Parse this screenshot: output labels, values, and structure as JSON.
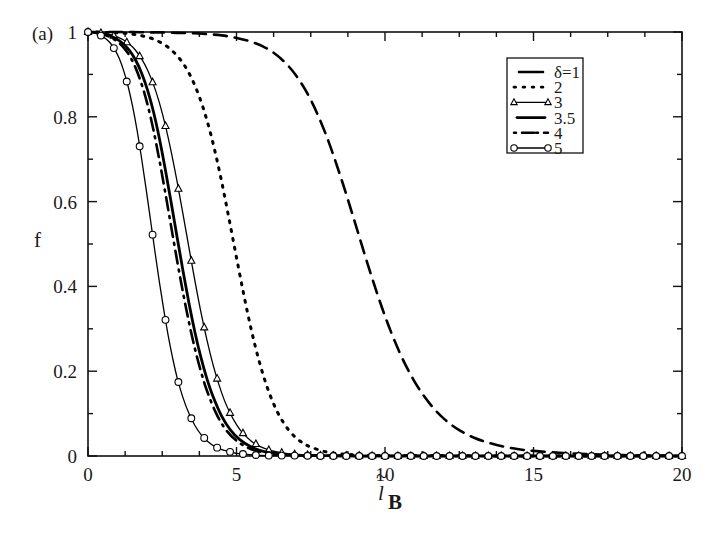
{
  "figure": {
    "panel_label": "(a)",
    "background_color": "#ffffff",
    "foreground_color": "#000000"
  },
  "chart_data": {
    "type": "line",
    "title": "",
    "subtitle": "",
    "panel": "(a)",
    "xlabel": "l~B",
    "xlabel_parts": {
      "base": "l",
      "accent": "~",
      "subscript": "B"
    },
    "ylabel": "f",
    "xlim": [
      0,
      20
    ],
    "ylim": [
      0,
      1
    ],
    "xticks": [
      0,
      5,
      10,
      15,
      20
    ],
    "xticklabels": [
      "0",
      "5",
      "10",
      "15",
      "20"
    ],
    "yticks": [
      0,
      0.2,
      0.4,
      0.6,
      0.8,
      1
    ],
    "yticklabels": [
      "0",
      "0.2",
      "0.4",
      "0.6",
      "0.8",
      "1"
    ],
    "x_minor_ticks": [
      1.25,
      2.5,
      3.75,
      6.25,
      7.5,
      8.75,
      11.25,
      12.5,
      13.75,
      16.25,
      17.5,
      18.75
    ],
    "y_minor_ticks": [
      0.1,
      0.3,
      0.5,
      0.7,
      0.9
    ],
    "grid": false,
    "legend_position": "upper right",
    "legend_title": "",
    "series": [
      {
        "name": "delta=1",
        "label": "δ=1",
        "linestyle": "dashed",
        "dasharray": "13,8",
        "linewidth": 2.6,
        "marker": "none",
        "midpoint_x": 9.3,
        "x": [
          0,
          0.5,
          1,
          1.5,
          2,
          2.5,
          3,
          3.5,
          4,
          4.5,
          5,
          5.5,
          6,
          6.5,
          7,
          7.5,
          8,
          8.5,
          9,
          9.5,
          10,
          10.5,
          11,
          11.5,
          12,
          12.5,
          13,
          13.5,
          14,
          14.5,
          15,
          16,
          17,
          18,
          19,
          20
        ],
        "y": [
          1,
          1,
          1,
          1,
          0.999,
          0.999,
          0.998,
          0.997,
          0.995,
          0.992,
          0.986,
          0.977,
          0.962,
          0.937,
          0.898,
          0.84,
          0.76,
          0.66,
          0.548,
          0.434,
          0.33,
          0.243,
          0.175,
          0.124,
          0.087,
          0.061,
          0.043,
          0.031,
          0.022,
          0.016,
          0.012,
          0.007,
          0.004,
          0.002,
          0.001,
          0.001
        ]
      },
      {
        "name": "delta=2",
        "label": "2",
        "linestyle": "dotted",
        "dasharray": "2,7",
        "linewidth": 3.0,
        "marker": "none",
        "midpoint_x": 4.9,
        "x": [
          0,
          0.25,
          0.5,
          0.75,
          1,
          1.25,
          1.5,
          1.75,
          2,
          2.25,
          2.5,
          2.75,
          3,
          3.25,
          3.5,
          3.75,
          4,
          4.25,
          4.5,
          4.75,
          5,
          5.25,
          5.5,
          5.75,
          6,
          6.25,
          6.5,
          6.75,
          7,
          7.25,
          7.5,
          8,
          8.5,
          9,
          10,
          12,
          14,
          16,
          18,
          20
        ],
        "y": [
          1,
          1,
          0.999,
          0.999,
          0.998,
          0.997,
          0.995,
          0.992,
          0.988,
          0.982,
          0.973,
          0.961,
          0.944,
          0.921,
          0.889,
          0.847,
          0.793,
          0.726,
          0.647,
          0.559,
          0.468,
          0.379,
          0.297,
          0.227,
          0.169,
          0.123,
          0.088,
          0.062,
          0.043,
          0.03,
          0.021,
          0.01,
          0.005,
          0.003,
          0.001,
          0.001,
          0,
          0,
          0,
          0
        ]
      },
      {
        "name": "delta=3",
        "label": "3",
        "linestyle": "solid",
        "dasharray": "",
        "linewidth": 1.3,
        "marker": "triangle",
        "midpoint_x": 3.1,
        "x": [
          0,
          0.2,
          0.4,
          0.6,
          0.8,
          1,
          1.2,
          1.4,
          1.6,
          1.8,
          2,
          2.2,
          2.4,
          2.6,
          2.8,
          3,
          3.2,
          3.4,
          3.6,
          3.8,
          4,
          4.2,
          4.4,
          4.6,
          4.8,
          5,
          5.2,
          5.5,
          5.8,
          6.1,
          6.5,
          7,
          7.5,
          8,
          9,
          10,
          12,
          14,
          16,
          18,
          20
        ],
        "y": [
          1,
          0.999,
          0.998,
          0.996,
          0.993,
          0.988,
          0.981,
          0.971,
          0.957,
          0.937,
          0.911,
          0.877,
          0.834,
          0.781,
          0.718,
          0.647,
          0.57,
          0.491,
          0.413,
          0.34,
          0.275,
          0.218,
          0.17,
          0.13,
          0.099,
          0.074,
          0.055,
          0.035,
          0.022,
          0.014,
          0.008,
          0.004,
          0.002,
          0.001,
          0.001,
          0,
          0,
          0,
          0,
          0,
          0
        ]
      },
      {
        "name": "delta=3.5",
        "label": "3.5",
        "linestyle": "solid",
        "dasharray": "",
        "linewidth": 2.8,
        "marker": "none",
        "midpoint_x": 2.5,
        "x": [
          0,
          0.2,
          0.4,
          0.6,
          0.8,
          1,
          1.2,
          1.4,
          1.6,
          1.8,
          2,
          2.2,
          2.4,
          2.6,
          2.8,
          3,
          3.2,
          3.4,
          3.6,
          3.8,
          4,
          4.2,
          4.5,
          4.8,
          5.1,
          5.5,
          6,
          6.5,
          7,
          8,
          9,
          10,
          12,
          14,
          16,
          18,
          20
        ],
        "y": [
          1,
          0.999,
          0.997,
          0.994,
          0.989,
          0.982,
          0.971,
          0.956,
          0.934,
          0.904,
          0.864,
          0.813,
          0.75,
          0.677,
          0.598,
          0.516,
          0.436,
          0.36,
          0.292,
          0.233,
          0.183,
          0.142,
          0.094,
          0.061,
          0.039,
          0.021,
          0.009,
          0.005,
          0.002,
          0.001,
          0,
          0,
          0,
          0,
          0,
          0,
          0
        ]
      },
      {
        "name": "delta=4",
        "label": "4",
        "linestyle": "dashdot",
        "dasharray": "2,6,13,6",
        "linewidth": 2.6,
        "marker": "none",
        "midpoint_x": 2.2,
        "x": [
          0,
          0.2,
          0.4,
          0.6,
          0.8,
          1,
          1.2,
          1.4,
          1.6,
          1.8,
          2,
          2.2,
          2.4,
          2.6,
          2.8,
          3,
          3.2,
          3.4,
          3.6,
          3.8,
          4,
          4.3,
          4.6,
          5,
          5.5,
          6,
          6.5,
          7,
          8,
          9,
          10,
          12,
          14,
          16,
          18,
          20
        ],
        "y": [
          1,
          0.999,
          0.996,
          0.992,
          0.986,
          0.977,
          0.963,
          0.944,
          0.916,
          0.878,
          0.83,
          0.77,
          0.699,
          0.622,
          0.541,
          0.461,
          0.385,
          0.315,
          0.253,
          0.2,
          0.155,
          0.103,
          0.066,
          0.036,
          0.016,
          0.008,
          0.004,
          0.002,
          0.001,
          0,
          0,
          0,
          0,
          0,
          0,
          0
        ]
      },
      {
        "name": "delta=5",
        "label": "5",
        "linestyle": "solid",
        "dasharray": "",
        "linewidth": 1.3,
        "marker": "circle",
        "midpoint_x": 1.8,
        "x": [
          0,
          0.15,
          0.3,
          0.45,
          0.6,
          0.75,
          0.9,
          1.05,
          1.2,
          1.35,
          1.5,
          1.65,
          1.8,
          1.95,
          2.1,
          2.25,
          2.4,
          2.55,
          2.7,
          2.85,
          3,
          3.2,
          3.4,
          3.6,
          3.8,
          4,
          4.3,
          4.6,
          5,
          5.5,
          6,
          7,
          8,
          10,
          12,
          14,
          16,
          18,
          20
        ],
        "y": [
          1,
          0.999,
          0.996,
          0.991,
          0.984,
          0.974,
          0.959,
          0.938,
          0.909,
          0.872,
          0.825,
          0.769,
          0.704,
          0.633,
          0.559,
          0.484,
          0.412,
          0.345,
          0.284,
          0.231,
          0.185,
          0.137,
          0.1,
          0.072,
          0.051,
          0.036,
          0.021,
          0.013,
          0.006,
          0.003,
          0.001,
          0.001,
          0,
          0,
          0,
          0,
          0,
          0,
          0
        ]
      }
    ]
  },
  "legend": {
    "entries": [
      {
        "label": "δ=1",
        "style": "dashed"
      },
      {
        "label": "2",
        "style": "dotted"
      },
      {
        "label": "3",
        "style": "solid-triangle"
      },
      {
        "label": "3.5",
        "style": "solid-thick"
      },
      {
        "label": "4",
        "style": "dashdot"
      },
      {
        "label": "5",
        "style": "solid-circle"
      }
    ]
  }
}
